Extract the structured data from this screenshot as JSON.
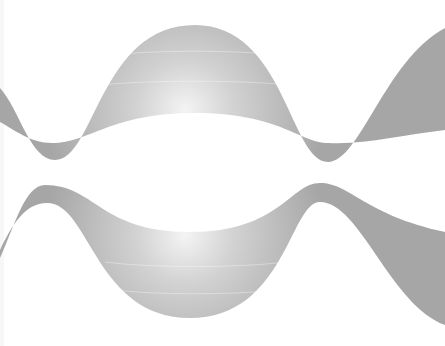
{
  "graphic": {
    "description": "Two mirrored wavy gray ribbon bands on white background",
    "background_color": "#ffffff",
    "band_colors": {
      "base": "#a8a8a8",
      "mid": "#c4c4c4",
      "highlight": "#f2f2f2"
    },
    "bands": [
      {
        "name": "upper-wave-band",
        "peak_x": 195,
        "outer_top_y": 25,
        "inner_bottom_y": 113,
        "valleys_x": [
          50,
          325
        ]
      },
      {
        "name": "lower-wave-band",
        "trough_x": 190,
        "outer_bottom_y": 318,
        "inner_top_y": 232,
        "peaks_x": [
          45,
          320
        ]
      }
    ]
  }
}
